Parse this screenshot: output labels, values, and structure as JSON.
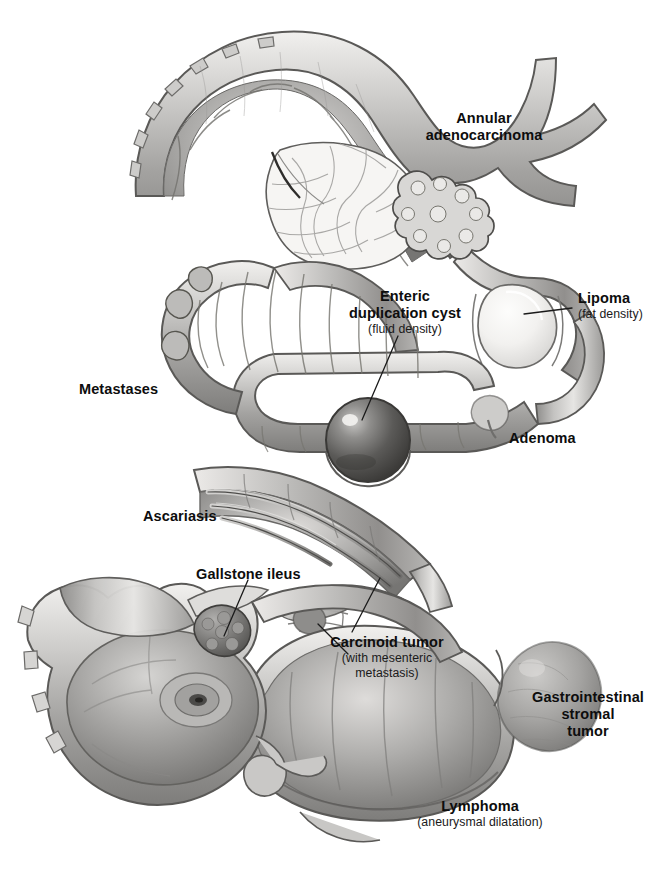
{
  "figure": {
    "style": "grayscale medical illustration",
    "width": 661,
    "height": 874,
    "background_color": "#ffffff",
    "text_color": "#0d0d0d",
    "subtext_color": "#1a1a1a",
    "leader_line_color": "#1a1a1a"
  },
  "labels": [
    {
      "id": "annular-adenocarcinoma",
      "lines": [
        "Annular",
        "adenocarcinoma"
      ],
      "sub": "",
      "align": "center",
      "x": 484,
      "y": 118
    },
    {
      "id": "enteric-duplication-cyst",
      "lines": [
        "Enteric",
        "duplication cyst"
      ],
      "sub": "(fluid density)",
      "align": "center",
      "x": 405,
      "y": 296
    },
    {
      "id": "lipoma",
      "lines": [
        "Lipoma"
      ],
      "sub": "(fat density)",
      "align": "left",
      "x": 578,
      "y": 294
    },
    {
      "id": "metastases",
      "lines": [
        "Metastases"
      ],
      "sub": "",
      "align": "left",
      "x": 79,
      "y": 384
    },
    {
      "id": "adenoma",
      "lines": [
        "Adenoma"
      ],
      "sub": "",
      "align": "left",
      "x": 509,
      "y": 433
    },
    {
      "id": "ascariasis",
      "lines": [
        "Ascariasis"
      ],
      "sub": "",
      "align": "left",
      "x": 143,
      "y": 511
    },
    {
      "id": "gallstone-ileus",
      "lines": [
        "Gallstone ileus"
      ],
      "sub": "",
      "align": "left",
      "x": 196,
      "y": 569
    },
    {
      "id": "carcinoid-tumor",
      "lines": [
        "Carcinoid tumor"
      ],
      "sub": "(with mesenteric\nmetastasis)",
      "align": "center",
      "x": 387,
      "y": 641
    },
    {
      "id": "gastrointestinal-stromal-tumor",
      "lines": [
        "Gastrointestinal",
        "stromal",
        "tumor"
      ],
      "sub": "",
      "align": "center",
      "x": 588,
      "y": 697
    },
    {
      "id": "lymphoma",
      "lines": [
        "Lymphoma"
      ],
      "sub": "(aneurysmal dilatation)",
      "align": "center",
      "x": 480,
      "y": 805
    }
  ],
  "label_text": {
    "annular_adenocarcinoma_l1": "Annular",
    "annular_adenocarcinoma_l2": "adenocarcinoma",
    "enteric_cyst_l1": "Enteric",
    "enteric_cyst_l2": "duplication cyst",
    "enteric_cyst_sub": "(fluid density)",
    "lipoma": "Lipoma",
    "lipoma_sub": "(fat density)",
    "metastases": "Metastases",
    "adenoma": "Adenoma",
    "ascariasis": "Ascariasis",
    "gallstone_ileus": "Gallstone ileus",
    "carcinoid": "Carcinoid tumor",
    "carcinoid_sub_l1": "(with mesenteric",
    "carcinoid_sub_l2": "metastasis)",
    "gist_l1": "Gastrointestinal",
    "gist_l2": "stromal",
    "gist_l3": "tumor",
    "lymphoma": "Lymphoma",
    "lymphoma_sub": "(aneurysmal dilatation)"
  },
  "anatomy": {
    "structures": [
      {
        "id": "proximal-jejunum-loop",
        "name": "Proximal small bowel loop (cutaway)",
        "region": "top-left"
      },
      {
        "id": "annular-lesion",
        "name": "Annular constricting adenocarcinoma",
        "region": "top-right"
      },
      {
        "id": "intraluminal-mass",
        "name": "Intraluminal lobulated mass (bolus)",
        "region": "top-center"
      },
      {
        "id": "lipoma-mass",
        "name": "Submucosal fat-density lipoma",
        "region": "right-upper"
      },
      {
        "id": "duplication-cyst",
        "name": "Spherical fluid-filled duplication cyst",
        "region": "mid-center"
      },
      {
        "id": "metastatic-nodules",
        "name": "Serosal metastatic nodules",
        "region": "mid-left"
      },
      {
        "id": "adenoma-polyp",
        "name": "Polypoid adenoma",
        "region": "mid-right"
      },
      {
        "id": "ascaris-worms",
        "name": "Intraluminal Ascaris worms",
        "region": "mid-lower"
      },
      {
        "id": "cecum",
        "name": "Cecum with ileocecal valve",
        "region": "bottom-left"
      },
      {
        "id": "appendix",
        "name": "Vermiform appendix",
        "region": "bottom-left"
      },
      {
        "id": "gallstone",
        "name": "Impacted gallstone at ileum",
        "region": "bottom-left-center"
      },
      {
        "id": "carcinoid-mass",
        "name": "Carcinoid tumor with desmoplastic mesenteric reaction",
        "region": "bottom-center"
      },
      {
        "id": "gist-mass",
        "name": "Exophytic gastrointestinal stromal tumor",
        "region": "bottom-right"
      },
      {
        "id": "lymphoma-segment",
        "name": "Aneurysmally dilated lymphomatous segment",
        "region": "bottom-center"
      }
    ]
  },
  "palette": {
    "wall_light": "#e4e3e1",
    "wall_mid": "#b8b7b5",
    "wall_dark": "#8d8c8a",
    "lumen_deep": "#6f6e6c",
    "serosa_edge": "#5c5b59",
    "highlight": "#f4f3f1",
    "cyst_dark": "#4b4a48",
    "lipoma_fill": "#f0efed",
    "outline": "#4a4947"
  }
}
